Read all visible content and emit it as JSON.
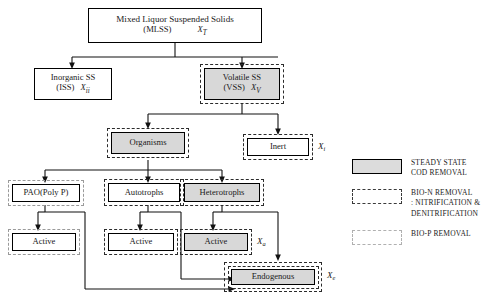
{
  "diagram": {
    "nodes": {
      "mlss": {
        "line1": "Mixed Liquor Suspended Solids",
        "line2": "(MLSS)",
        "var": "X",
        "sub": "T"
      },
      "iss": {
        "line1": "Inorganic SS",
        "line2": "(ISS)",
        "var": "X",
        "sub": "ii"
      },
      "vss": {
        "line1": "Volatile SS",
        "line2": "(VSS)",
        "var": "X",
        "sub": "V"
      },
      "organisms": {
        "label": "Organisms"
      },
      "inert": {
        "label": "Inert",
        "var": "X",
        "sub": "i"
      },
      "pao": {
        "label": "PAO(Poly P)"
      },
      "autotrophs": {
        "label": "Autotrophs"
      },
      "heterotrophs": {
        "label": "Heterotrophs"
      },
      "pao_active": {
        "label": "Active"
      },
      "auto_active": {
        "label": "Active"
      },
      "het_active": {
        "label": "Active",
        "var": "X",
        "sub": "a"
      },
      "endogenous": {
        "label": "Endogenous",
        "var": "X",
        "sub": "e"
      }
    }
  },
  "legend": {
    "items": [
      {
        "swatch": "steady-state-swatch",
        "text": "STEADY STATE\nCOD REMOVAL"
      },
      {
        "swatch": "bio-n-swatch",
        "text": "BIO-N REMOVAL\n: NITRIFICATION &\nDENITRIFICATION"
      },
      {
        "swatch": "bio-p-swatch",
        "text": "BIO-P REMOVAL"
      }
    ]
  },
  "colors": {
    "shaded_fill": "#d8d8d8",
    "line": "#000000",
    "bio_n_border": "#2b2b2b",
    "bio_p_border": "#9a9a9a"
  }
}
